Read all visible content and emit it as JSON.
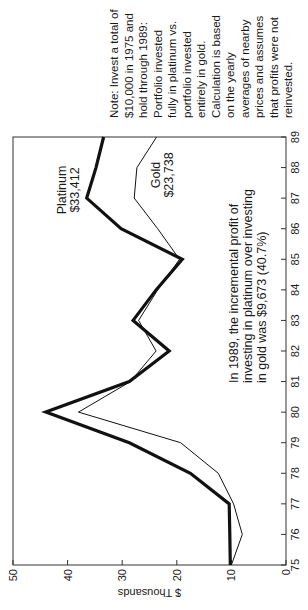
{
  "chart_data": {
    "type": "line",
    "orientation": "rotated 90 degrees counter-clockwise",
    "title": "",
    "xlabel": "",
    "ylabel": "$ Thousands",
    "x": [
      "75",
      "76",
      "77",
      "78",
      "79",
      "80",
      "81",
      "82",
      "83",
      "84",
      "85",
      "86",
      "87",
      "88",
      "89"
    ],
    "x_ticks": [
      "75",
      "76",
      "77",
      "78",
      "79",
      "80",
      "81",
      "82",
      "83",
      "84",
      "85",
      "86",
      "87",
      "88",
      "89"
    ],
    "y_ticks": [
      "0",
      "10",
      "20",
      "30",
      "40",
      "50"
    ],
    "ylim": [
      0,
      50
    ],
    "grid": false,
    "legend": "inline labels",
    "series": [
      {
        "name": "Platinum",
        "label_value": "$33,412",
        "style": "thick",
        "values": [
          10.2,
          10.3,
          10.4,
          17.5,
          28.7,
          44.0,
          28.7,
          21.4,
          28.0,
          23.8,
          19.0,
          30.2,
          36.5,
          34.8,
          33.4
        ]
      },
      {
        "name": "Gold",
        "label_value": "$23,738",
        "style": "thin",
        "values": [
          10.0,
          8.0,
          9.6,
          12.4,
          19.3,
          38.0,
          28.5,
          23.8,
          27.0,
          23.5,
          19.5,
          23.5,
          27.8,
          27.3,
          23.7
        ]
      }
    ],
    "annotations": [
      "In 1989, the incremental profit of",
      "investing in platinum over investing",
      "in gold was $9,673 (40.7%)"
    ],
    "note": [
      "Note: Invest a total of",
      "$10,000 in 1975 and",
      "hold through 1989:",
      "Portfolio invested",
      "fully in platinum vs.",
      "portfolio invested",
      "entirely in gold.",
      "Calculation is based",
      "on the yearly",
      "averages of nearby",
      "prices and assumes",
      "that profits were not",
      "reinvested."
    ]
  },
  "colors": {
    "line": "#111111",
    "axis": "#333333",
    "background": "#ffffff"
  }
}
